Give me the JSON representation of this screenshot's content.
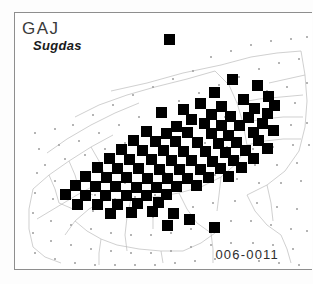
{
  "figure": {
    "kind": "species-distribution-map",
    "caption_genus": "GAJ",
    "caption_species": "Sugdas",
    "sheet_code": "006-0011",
    "frame": {
      "x": 14,
      "y": 12,
      "width": 298,
      "height": 258
    },
    "colors": {
      "occurrence": "#000000",
      "frame": "#8e8e8e",
      "basemap_line": "#b9b9b9",
      "basemap_dot": "#9a9a9a",
      "background": "#ffffff",
      "genus_text": "#3a3a3a",
      "species_text": "#1a1a1a"
    }
  },
  "chart_data": {
    "type": "scatter",
    "title": "GAJ Sugdas",
    "subtitle": "006-0011",
    "xlabel": "",
    "ylabel": "",
    "grid": true,
    "legend": "none",
    "xlim": [
      0,
      298
    ],
    "ylim": [
      0,
      258
    ],
    "marker": {
      "shape": "square",
      "size": 11,
      "color": "#000000"
    },
    "series": [
      {
        "name": "occurrence-records",
        "count": 92,
        "points": [
          [
            154,
            26
          ],
          [
            217,
            66
          ],
          [
            242,
            72
          ],
          [
            199,
            79
          ],
          [
            253,
            83
          ],
          [
            228,
            86
          ],
          [
            185,
            90
          ],
          [
            206,
            93
          ],
          [
            168,
            96
          ],
          [
            239,
            95
          ],
          [
            259,
            92
          ],
          [
            146,
            99
          ],
          [
            196,
            101
          ],
          [
            215,
            103
          ],
          [
            176,
            106
          ],
          [
            233,
            104
          ],
          [
            252,
            100
          ],
          [
            189,
            110
          ],
          [
            206,
            112
          ],
          [
            161,
            113
          ],
          [
            224,
            112
          ],
          [
            247,
            110
          ],
          [
            131,
            118
          ],
          [
            151,
            120
          ],
          [
            172,
            119
          ],
          [
            196,
            120
          ],
          [
            213,
            122
          ],
          [
            238,
            119
          ],
          [
            258,
            117
          ],
          [
            118,
            127
          ],
          [
            140,
            128
          ],
          [
            160,
            128
          ],
          [
            182,
            129
          ],
          [
            203,
            130
          ],
          [
            221,
            129
          ],
          [
            243,
            127
          ],
          [
            106,
            136
          ],
          [
            127,
            137
          ],
          [
            148,
            137
          ],
          [
            168,
            138
          ],
          [
            190,
            138
          ],
          [
            210,
            139
          ],
          [
            230,
            137
          ],
          [
            252,
            135
          ],
          [
            94,
            145
          ],
          [
            114,
            146
          ],
          [
            136,
            146
          ],
          [
            156,
            147
          ],
          [
            176,
            147
          ],
          [
            197,
            148
          ],
          [
            218,
            147
          ],
          [
            238,
            145
          ],
          [
            82,
            154
          ],
          [
            102,
            155
          ],
          [
            123,
            155
          ],
          [
            144,
            156
          ],
          [
            164,
            156
          ],
          [
            185,
            156
          ],
          [
            205,
            155
          ],
          [
            226,
            154
          ],
          [
            70,
            163
          ],
          [
            91,
            164
          ],
          [
            111,
            164
          ],
          [
            132,
            165
          ],
          [
            152,
            165
          ],
          [
            172,
            165
          ],
          [
            193,
            164
          ],
          [
            213,
            163
          ],
          [
            60,
            172
          ],
          [
            80,
            173
          ],
          [
            100,
            173
          ],
          [
            121,
            174
          ],
          [
            141,
            174
          ],
          [
            161,
            173
          ],
          [
            181,
            172
          ],
          [
            50,
            181
          ],
          [
            70,
            182
          ],
          [
            90,
            182
          ],
          [
            111,
            182
          ],
          [
            131,
            182
          ],
          [
            151,
            181
          ],
          [
            62,
            191
          ],
          [
            82,
            191
          ],
          [
            102,
            191
          ],
          [
            122,
            190
          ],
          [
            143,
            189
          ],
          [
            95,
            200
          ],
          [
            116,
            199
          ],
          [
            137,
            198
          ],
          [
            158,
            200
          ],
          [
            174,
            206
          ],
          [
            152,
            212
          ],
          [
            199,
            214
          ]
        ]
      }
    ]
  }
}
